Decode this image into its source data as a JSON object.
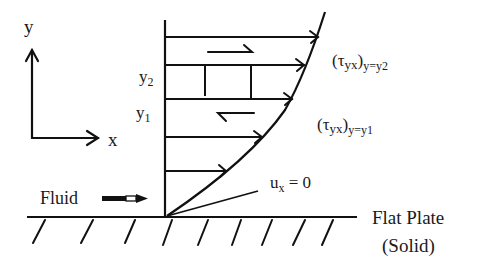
{
  "diagram": {
    "axis_labels": {
      "y": "y",
      "x": "x"
    },
    "levels": {
      "y2": "y",
      "y2_sub": "2",
      "y1": "y",
      "y1_sub": "1"
    },
    "shear_labels": {
      "upper": {
        "main": "(τ",
        "sub1": "yx",
        "close": ")",
        "sub2": "y=y2"
      },
      "lower": {
        "main": "(τ",
        "sub1": "yx",
        "close": ")",
        "sub2": "y=y1"
      }
    },
    "boundary_label": {
      "main": "u",
      "sub": "x",
      "rest": " = 0"
    },
    "fluid_label": "Fluid",
    "plate_label_line1": "Flat Plate",
    "plate_label_line2": "(Solid)",
    "velocity_arrows_y": [
      37,
      65,
      99,
      137,
      171
    ],
    "line_color": "#111111"
  }
}
